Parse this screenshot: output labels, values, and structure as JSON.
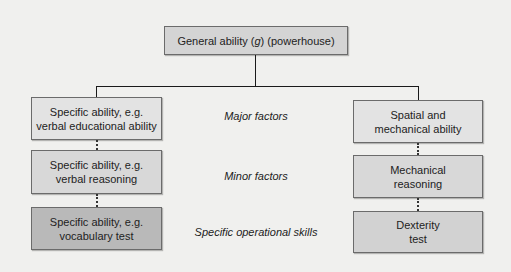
{
  "diagram": {
    "root": {
      "text_pre": "General ability (",
      "text_italic": "g",
      "text_post": ") (powerhouse)"
    },
    "left_branch": [
      {
        "line1": "Specific ability, e.g.",
        "line2": "verbal educational ability"
      },
      {
        "line1": "Specific ability, e.g.",
        "line2": "verbal reasoning"
      },
      {
        "line1": "Specific ability, e.g.",
        "line2": "vocabulary test"
      }
    ],
    "right_branch": [
      {
        "line1": "Spatial and",
        "line2": "mechanical ability"
      },
      {
        "line1": "Mechanical",
        "line2": "reasoning"
      },
      {
        "line1": "Dexterity",
        "line2": "test"
      }
    ],
    "level_labels": [
      "Major factors",
      "Minor factors",
      "Specific operational skills"
    ],
    "colors": {
      "background": "#f0f0ee",
      "root_fill": "#d4d4d4",
      "level1_fill": "#e3e3e3",
      "level2_fill": "#d8d8d8",
      "level3_fill": "#b9b9b9",
      "stroke": "#1a1a1a"
    }
  }
}
